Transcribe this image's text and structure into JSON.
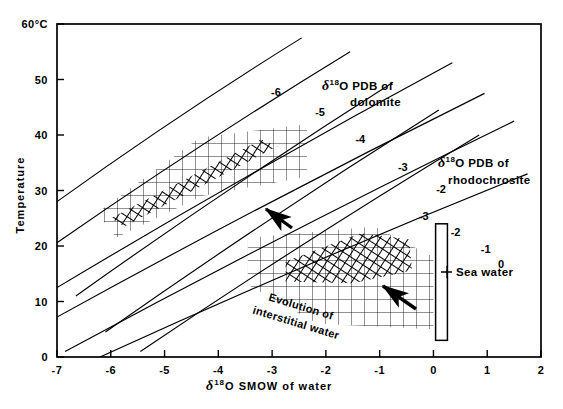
{
  "chart_data": {
    "type": "line",
    "title": "",
    "xlabel": "δ18O SMOW of water",
    "ylabel": "Temperature",
    "xlabel_parts": {
      "delta": "δ",
      "sup": "18",
      "rest": "O SMOW of water"
    },
    "ylabel_text": "Temperature",
    "xlim": [
      -7,
      2
    ],
    "ylim": [
      0,
      60
    ],
    "xticks": [
      -7,
      -6,
      -5,
      -4,
      -3,
      -2,
      -1,
      0,
      1,
      2
    ],
    "xticklabels": [
      "-7",
      "-6",
      "-5",
      "-4",
      "-3",
      "-2",
      "-1",
      "0",
      "1",
      "2"
    ],
    "yticks": [
      0,
      10,
      20,
      30,
      40,
      50,
      60
    ],
    "yticklabels": [
      "0",
      "10",
      "20",
      "30",
      "40",
      "50",
      "60°C"
    ],
    "ytop_label": "60°C",
    "grid": false,
    "legend_position": "inline-annotations",
    "series": [
      {
        "name": "dolomite -6",
        "value": -6,
        "family": "dolomite",
        "label": "-6",
        "x": [
          -7.0,
          -2.45
        ],
        "y": [
          28.0,
          57.5
        ],
        "label_x": -3.02,
        "label_y": 47.0
      },
      {
        "name": "dolomite -5",
        "value": -5,
        "family": "dolomite",
        "label": "-5",
        "x": [
          -7.0,
          -1.55
        ],
        "y": [
          20.6,
          55.0
        ],
        "label_x": -2.2,
        "label_y": 43.5
      },
      {
        "name": "dolomite -4",
        "value": -4,
        "family": "dolomite",
        "label": "-4",
        "x": [
          -6.65,
          -0.75
        ],
        "y": [
          11.0,
          49.5
        ],
        "label_x": -1.45,
        "label_y": 38.6
      },
      {
        "name": "dolomite -3",
        "value": -3,
        "family": "dolomite",
        "label": "-3",
        "x": [
          -6.1,
          0.1
        ],
        "y": [
          4.5,
          44.5
        ],
        "label_x": -0.66,
        "label_y": 33.5
      },
      {
        "name": "dolomite -2",
        "value": -2,
        "family": "dolomite",
        "label": "-2",
        "x": [
          -5.45,
          0.85
        ],
        "y": [
          1.0,
          40.0
        ],
        "label_x": 0.05,
        "label_y": 29.6
      },
      {
        "name": "rhodochrosite -3",
        "value": -3,
        "family": "rhodochrosite",
        "label": "-3",
        "x": [
          -7.0,
          0.35
        ],
        "y": [
          12.5,
          53.0
        ],
        "label_x": -0.27,
        "label_y": 24.6
      },
      {
        "name": "rhodochrosite -2",
        "value": -2,
        "family": "rhodochrosite",
        "label": "-2",
        "x": [
          -7.0,
          0.95
        ],
        "y": [
          7.2,
          47.5
        ],
        "label_x": 0.32,
        "label_y": 21.8
      },
      {
        "name": "rhodochrosite -1",
        "value": -1,
        "family": "rhodochrosite",
        "label": "-1",
        "x": [
          -6.85,
          1.5
        ],
        "y": [
          1.0,
          42.5
        ],
        "label_x": 0.88,
        "label_y": 18.8
      },
      {
        "name": "rhodochrosite 0",
        "value": 0,
        "family": "rhodochrosite",
        "label": "0",
        "x": [
          -6.2,
          1.75
        ],
        "y": [
          0.0,
          33.0
        ],
        "label_x": 1.2,
        "label_y": 16.0
      }
    ],
    "fields": [
      {
        "name": "dolomite-field",
        "style": "cross-hatch",
        "polygon": [
          [
            -6.25,
            26.0
          ],
          [
            -4.35,
            39.5
          ],
          [
            -2.35,
            42.0
          ],
          [
            -2.35,
            32.5
          ],
          [
            -4.3,
            29.0
          ],
          [
            -5.9,
            21.5
          ]
        ]
      },
      {
        "name": "dolomite-core-band",
        "style": "dense-hatch",
        "polygon": [
          [
            -6.0,
            25.0
          ],
          [
            -3.2,
            39.2
          ],
          [
            -2.9,
            38.0
          ],
          [
            -5.75,
            23.5
          ]
        ]
      },
      {
        "name": "interstitial-field",
        "style": "cross-hatch",
        "polygon": [
          [
            -3.45,
            21.5
          ],
          [
            -1.1,
            23.5
          ],
          [
            0.0,
            18.0
          ],
          [
            0.0,
            5.0
          ],
          [
            -2.15,
            6.0
          ],
          [
            -3.45,
            13.0
          ]
        ]
      },
      {
        "name": "rhodochrosite-core-band",
        "style": "dense-hatch",
        "polygon": [
          [
            -2.75,
            17.2
          ],
          [
            -1.35,
            22.3
          ],
          [
            -0.45,
            21.2
          ],
          [
            -0.4,
            15.6
          ],
          [
            -1.5,
            13.3
          ],
          [
            -2.75,
            13.6
          ]
        ]
      }
    ],
    "annotations": [
      {
        "name": "dolomite-group-label",
        "line1_delta": "δ",
        "line1_sup": "18",
        "line1_rest": "O PDB of",
        "line2": "dolomite",
        "x": 322,
        "y": 90
      },
      {
        "name": "rhodochrosite-group-label",
        "line1_delta": "δ",
        "line1_sup": "18",
        "line1_rest": "O PDB of",
        "line2": "rhodochrosite",
        "x": 438,
        "y": 167
      },
      {
        "name": "sea-water-label",
        "text": "Sea water",
        "x": 455,
        "y": 272
      },
      {
        "name": "evolution-label",
        "line1": "Evolution of",
        "line2": "interstitial water",
        "x": 300,
        "y": 310,
        "rotation": 17
      }
    ],
    "markers": [
      {
        "name": "sea-water-box",
        "x0": 0.04,
        "x1": 0.26,
        "y0": 3.0,
        "y1": 24.0
      },
      {
        "name": "arrow-upper",
        "x1": 292,
        "y1": 228,
        "x2": 266,
        "y2": 209
      },
      {
        "name": "arrow-lower",
        "x1": 416,
        "y1": 309,
        "x2": 383,
        "y2": 286
      }
    ]
  },
  "axis": {
    "x_label_delta": "δ",
    "x_label_sup": "18",
    "x_label_rest": "O SMOW of water",
    "y_label": "Temperature",
    "y_top": "60°C"
  }
}
